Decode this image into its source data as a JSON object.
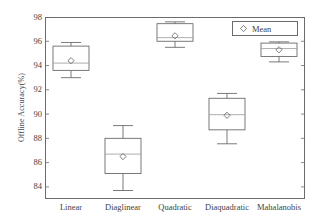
{
  "chart_data": {
    "type": "box",
    "title": "",
    "xlabel": "",
    "ylabel": "Offline Accuracy(%)",
    "ylim": [
      83,
      98
    ],
    "yticks": [
      84,
      86,
      88,
      90,
      92,
      94,
      96,
      98
    ],
    "grid": false,
    "legend": {
      "position": "top-right",
      "entries": [
        {
          "label": "Mean",
          "marker": "diamond-open"
        }
      ]
    },
    "categories": [
      "Linear",
      "Diaglinear",
      "Quadratic",
      "Diaquadratic",
      "Mahalanobis"
    ],
    "boxes": [
      {
        "category": "Linear",
        "whisker_low": 93.0,
        "q1": 93.6,
        "median": 94.2,
        "q3": 95.6,
        "whisker_high": 95.9,
        "mean": 94.4
      },
      {
        "category": "Diaglinear",
        "whisker_low": 83.7,
        "q1": 85.1,
        "median": 86.7,
        "q3": 88.0,
        "whisker_high": 89.05,
        "mean": 86.5
      },
      {
        "category": "Quadratic",
        "whisker_low": 95.5,
        "q1": 96.0,
        "median": 96.3,
        "q3": 97.45,
        "whisker_high": 97.6,
        "mean": 96.45
      },
      {
        "category": "Diaquadratic",
        "whisker_low": 87.55,
        "q1": 88.7,
        "median": 89.95,
        "q3": 91.3,
        "whisker_high": 91.7,
        "mean": 89.9
      },
      {
        "category": "Mahalanobis",
        "whisker_low": 94.3,
        "q1": 94.75,
        "median": 95.4,
        "q3": 95.85,
        "whisker_high": 95.95,
        "mean": 95.3
      }
    ],
    "colors": {
      "line": "#6b6b6b",
      "median": "#9a9a9a",
      "text": "#3f3f3f",
      "background": "#ffffff"
    }
  }
}
